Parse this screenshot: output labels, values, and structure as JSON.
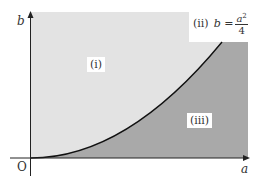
{
  "figure": {
    "axes": {
      "x_label": "a",
      "y_label": "b",
      "origin_label": "O"
    },
    "curve": {
      "label": "(ii)",
      "equation_lhs": "b =",
      "equation_num_var": "a",
      "equation_num_exp": "2",
      "equation_den": "4"
    },
    "regions": [
      {
        "id": "i",
        "label": "(i)",
        "color": "#e3e3e3"
      },
      {
        "id": "iii",
        "label": "(iii)",
        "color": "#a9a9a9"
      }
    ],
    "colors": {
      "axis": "#222222",
      "curve": "#111111",
      "light_region": "#e3e3e3",
      "dark_region": "#a9a9a9"
    }
  }
}
